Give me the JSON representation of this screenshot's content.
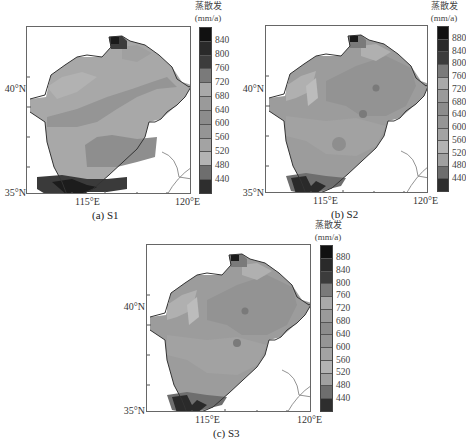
{
  "chart_data": [
    {
      "type": "heatmap",
      "title": "(a) S1",
      "panel": "a",
      "xlabel": "",
      "ylabel": "",
      "xticks": [
        "115°E",
        "120°E"
      ],
      "yticks": [
        "40°N",
        "35°N"
      ],
      "colorbar": {
        "title": "蒸散发",
        "unit": "(mm/a)",
        "ticks": [
          "840",
          "800",
          "760",
          "720",
          "680",
          "640",
          "600",
          "560",
          "520",
          "480",
          "440"
        ],
        "bins": 12
      },
      "description": "Annual evapotranspiration over Hai River basin; mostly 560-680 mm/a, high values (>800) in south, low tip in north"
    },
    {
      "type": "heatmap",
      "title": "(b) S2",
      "panel": "b",
      "xticks": [
        "115°E",
        "120°E"
      ],
      "yticks": [
        "40°N",
        "35°N"
      ],
      "colorbar": {
        "title": "蒸散发",
        "unit": "(mm/a)",
        "ticks": [
          "880",
          "840",
          "800",
          "760",
          "720",
          "680",
          "640",
          "600",
          "560",
          "520",
          "480",
          "440"
        ],
        "bins": 13
      },
      "description": "Mostly 600-680 mm/a with local spots, high values (>800) in south"
    },
    {
      "type": "heatmap",
      "title": "(c) S3",
      "panel": "c",
      "xticks": [
        "115°E",
        "120°E"
      ],
      "yticks": [
        "40°N",
        "35°N"
      ],
      "colorbar": {
        "title": "蒸散发",
        "unit": "(mm/a)",
        "ticks": [
          "880",
          "840",
          "800",
          "760",
          "720",
          "680",
          "640",
          "600",
          "560",
          "520",
          "480",
          "440"
        ],
        "bins": 13
      },
      "description": "Similar to S2; mostly 600-680 mm/a, high values in south"
    }
  ],
  "panels": {
    "a": {
      "caption": "(a) S1",
      "lat40": "40°N",
      "lat35": "35°N",
      "lon115": "115°E",
      "lon120": "120°E",
      "cb_title": "蒸散发",
      "cb_unit": "(mm/a)",
      "cb_ticks": [
        "840",
        "800",
        "760",
        "720",
        "680",
        "640",
        "600",
        "560",
        "520",
        "480",
        "440"
      ]
    },
    "b": {
      "caption": "(b) S2",
      "lat40": "40°N",
      "lat35": "35°N",
      "lon115": "115°E",
      "lon120": "120°E",
      "cb_title": "蒸散发",
      "cb_unit": "(mm/a)",
      "cb_ticks": [
        "880",
        "840",
        "800",
        "760",
        "720",
        "680",
        "640",
        "600",
        "560",
        "520",
        "480",
        "440"
      ]
    },
    "c": {
      "caption": "(c) S3",
      "lat40": "40°N",
      "lat35": "35°N",
      "lon115": "115°E",
      "lon120": "120°E",
      "cb_title": "蒸散发",
      "cb_unit": "(mm/a)",
      "cb_ticks": [
        "880",
        "840",
        "800",
        "760",
        "720",
        "680",
        "640",
        "600",
        "560",
        "520",
        "480",
        "440"
      ]
    }
  },
  "colors": {
    "bins13": [
      "#111111",
      "#2a2a2a",
      "#3c3c3c",
      "#7a7a7a",
      "#a9a9a9",
      "#9a9a9a",
      "#8c8c8c",
      "#959595",
      "#a3a3a3",
      "#b3b3b3",
      "#a0a0a0",
      "#6e6e6e",
      "#2e2e2e"
    ],
    "bins12": [
      "#111111",
      "#2a2a2a",
      "#3c3c3c",
      "#7a7a7a",
      "#a9a9a9",
      "#9a9a9a",
      "#8c8c8c",
      "#959595",
      "#a3a3a3",
      "#b3b3b3",
      "#6e6e6e",
      "#2e2e2e"
    ]
  }
}
